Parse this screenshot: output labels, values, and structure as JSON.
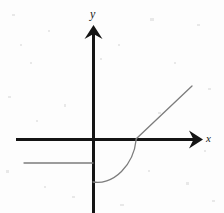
{
  "figure": {
    "width": 224,
    "height": 213,
    "background_color": "#fdfdfd"
  },
  "axes": {
    "x_axis": {
      "label": "x",
      "color": "#141414",
      "stroke_width": 3,
      "start": [
        16,
        139
      ],
      "end": [
        202,
        139
      ],
      "arrow": "right"
    },
    "y_axis": {
      "label": "y",
      "color": "#141414",
      "stroke_width": 3,
      "start": [
        93,
        213
      ],
      "end": [
        93,
        25
      ],
      "arrow": "up"
    },
    "origin": [
      93,
      139
    ]
  },
  "curves": [
    {
      "name": "left-horizontal-ray",
      "color": "#7c7c7c",
      "stroke_width": 1.3,
      "description": "horizontal ray left of the y-axis",
      "points": [
        [
          24,
          163
        ],
        [
          93,
          163
        ]
      ]
    },
    {
      "name": "rising-curve",
      "color": "#7c7c7c",
      "stroke_width": 1.3,
      "description": "curve from below the origin rising to the x-axis",
      "points": [
        [
          93,
          182
        ],
        [
          104,
          183
        ],
        [
          116,
          176
        ],
        [
          126,
          164
        ],
        [
          133,
          150
        ],
        [
          136,
          139
        ]
      ]
    },
    {
      "name": "rising-line",
      "color": "#7c7c7c",
      "stroke_width": 1.3,
      "description": "straight line rising to the upper right from the x-axis",
      "points": [
        [
          136,
          139
        ],
        [
          192,
          86
        ]
      ]
    }
  ],
  "chart_data": {
    "type": "line",
    "xlabel": "x",
    "ylabel": "y",
    "grid": false,
    "legend": null,
    "origin_pixel": [
      93,
      139
    ],
    "series": [
      {
        "name": "left branch (constant)",
        "style": "solid thin gray",
        "points_pixel": [
          [
            24,
            163
          ],
          [
            93,
            163
          ]
        ]
      },
      {
        "name": "middle branch (curved)",
        "style": "solid thin gray",
        "points_pixel": [
          [
            93,
            182
          ],
          [
            104,
            183
          ],
          [
            116,
            176
          ],
          [
            126,
            164
          ],
          [
            133,
            150
          ],
          [
            136,
            139
          ]
        ]
      },
      {
        "name": "right branch (linear)",
        "style": "solid thin gray",
        "points_pixel": [
          [
            136,
            139
          ],
          [
            192,
            86
          ]
        ]
      }
    ]
  }
}
